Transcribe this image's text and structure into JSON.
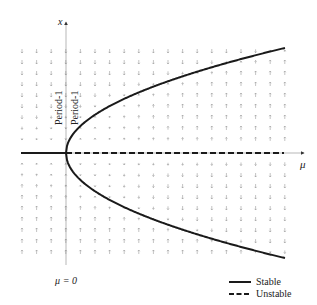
{
  "diagram": {
    "type": "bifurcation-diagram",
    "axes": {
      "x_label": "μ",
      "y_label": "x",
      "origin_px": [
        66,
        153
      ],
      "x_end_px": 306,
      "y_top_px": 20,
      "y_bottom_px": 265
    },
    "annotations": {
      "bifurcation_point_label": "μ = 0",
      "branch_label_left": "Period-1",
      "branch_label_right": "Period-1"
    },
    "legend": {
      "items": [
        {
          "label": "Stable",
          "style": "solid"
        },
        {
          "label": "Unstable",
          "style": "dashed"
        }
      ]
    },
    "branches": [
      {
        "name": "trivial-stable",
        "style": "solid",
        "range": "μ < 0",
        "x": 0
      },
      {
        "name": "trivial-unstable",
        "style": "dashed",
        "range": "μ > 0",
        "x": 0
      },
      {
        "name": "upper-stable",
        "style": "solid",
        "relation": "x = +√μ"
      },
      {
        "name": "lower-stable",
        "style": "solid",
        "relation": "x = -√μ"
      }
    ],
    "vector_field": {
      "columns": 19,
      "rows_above": 9,
      "rows_below": 9,
      "col_start_px": 22,
      "col_spacing_px": 14.6,
      "row_spacing_px": 11
    },
    "colors": {
      "curve": "#1a1a1a",
      "grid": "#9a9a9a",
      "text": "#222222"
    }
  }
}
